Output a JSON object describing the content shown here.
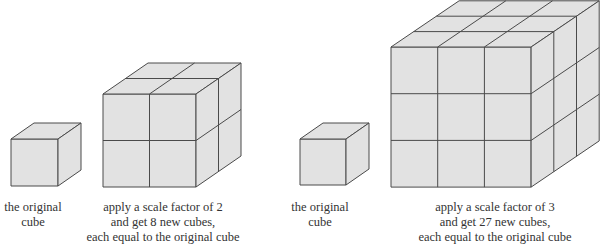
{
  "figure": {
    "panels": [
      {
        "id": "original-cube-1",
        "caption": [
          "the original",
          "cube"
        ],
        "scale_factor": 1,
        "cube_count": 1
      },
      {
        "id": "scaled-cube-2",
        "caption": [
          "apply a scale factor of 2",
          "and get 8 new cubes,",
          "each equal to the original cube"
        ],
        "scale_factor": 2,
        "cube_count": 8
      },
      {
        "id": "original-cube-2",
        "caption": [
          "the original",
          "cube"
        ],
        "scale_factor": 1,
        "cube_count": 1
      },
      {
        "id": "scaled-cube-3",
        "caption": [
          "apply a scale factor of 3",
          "and get 27 new cubes,",
          "each equal to the original cube"
        ],
        "scale_factor": 3,
        "cube_count": 27
      }
    ],
    "colors": {
      "face_fill": "#e2e2e2",
      "edge_stroke": "#4a4a4a",
      "text": "#333333",
      "background": "#ffffff"
    }
  }
}
